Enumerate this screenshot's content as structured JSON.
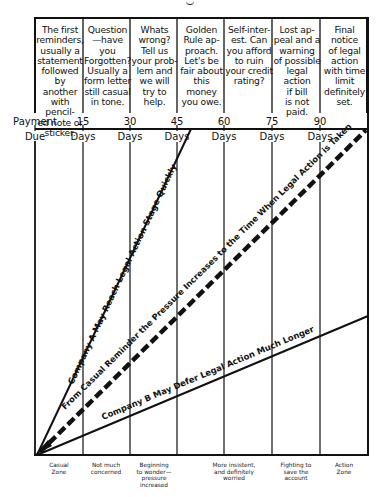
{
  "header": {
    "columns": [
      {
        "text": "The first\nreminders,\nusually a\nstatement\nfollowed by\nanother\nwith pencil-\ned note or\nsticker."
      },
      {
        "text": "Question\n—have you\nForgotten?\nUsually a\nform letter\nstill casual\nin tone."
      },
      {
        "text": "Whats\nwrong?\nTell us\nyour prob-\nlem and\nwe will\ntry to\nhelp."
      },
      {
        "text": "Golden\nRule ap-\nproach.\nLet's be\nfair about\nthis money\nyou owe."
      },
      {
        "text": "Self-inter-\nest. Can\nyou afford\nto ruin\nyour credit\nrating?"
      },
      {
        "text": "Lost ap-\npeal and a\nwarning\nof possible\nlegal action\nif bill\nis not\npaid."
      },
      {
        "text": "Final\nnotice\nof legal\naction\nwith time\nlimit\ndefinitely\nset."
      }
    ]
  },
  "axis": {
    "ticks": [
      {
        "top": "Payment",
        "bottom": "Due"
      },
      {
        "top": "15",
        "bottom": "Days"
      },
      {
        "top": "30",
        "bottom": "Days"
      },
      {
        "top": "45",
        "bottom": "Days"
      },
      {
        "top": "60",
        "bottom": "Days"
      },
      {
        "top": "75",
        "bottom": "Days"
      },
      {
        "top": "90",
        "bottom": "Days"
      }
    ]
  },
  "lines": {
    "company_a": "Company A May Reach Legal Action Stage Quickly",
    "pressure": "From Casual Reminder the Pressure Increases to the Time When Legal Action is Taken",
    "company_b": "Company B May Defer Legal Action Much Longer"
  },
  "zones": [
    {
      "text": "Casual\nZone"
    },
    {
      "text": "Not much\nconcerned"
    },
    {
      "text": "Beginning\nto wonder—\npressure\nincreased"
    },
    {
      "text": "More insistent,\nand definitely\nworried"
    },
    {
      "text": "Fighting to\nsave the\naccount"
    },
    {
      "text": "Action\nZone"
    }
  ],
  "colors": {
    "ink": "#111111",
    "background": "#ffffff"
  }
}
